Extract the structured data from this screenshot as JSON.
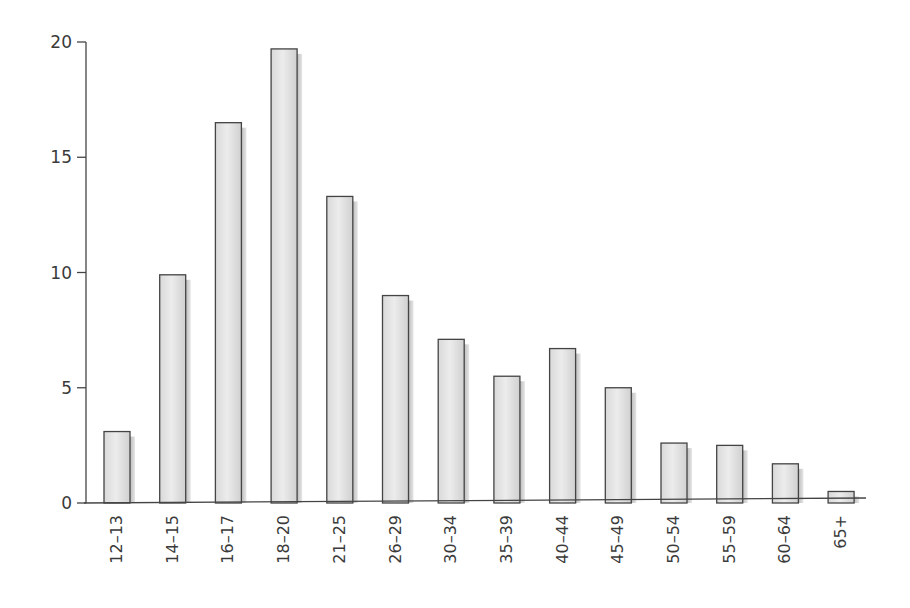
{
  "chart_data": {
    "type": "bar",
    "title": "",
    "xlabel": "",
    "ylabel": "",
    "categories": [
      "12–13",
      "14–15",
      "16–17",
      "18–20",
      "21–25",
      "26–29",
      "30–34",
      "35–39",
      "40–44",
      "45–49",
      "50–54",
      "55–59",
      "60–64",
      "65+"
    ],
    "values": [
      3.1,
      9.9,
      16.5,
      19.7,
      13.3,
      9.0,
      7.1,
      5.5,
      6.7,
      5.0,
      2.6,
      2.5,
      1.7,
      0.5
    ],
    "ylim": [
      0,
      20
    ],
    "yticks": [
      0,
      5,
      10,
      15,
      20
    ],
    "grid": false,
    "legend": null,
    "bar_fill": "#e2e2e2",
    "bar_edge": "#444444",
    "shadow": "#c8c8c8"
  }
}
